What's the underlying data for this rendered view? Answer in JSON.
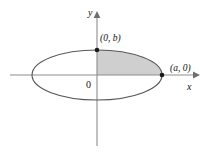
{
  "figure": {
    "background_color": "#ffffff",
    "axes": {
      "x_label": "x",
      "y_label": "y",
      "origin_label": "0",
      "axis_color": "#8d8d8d",
      "x_axis": {
        "start_x": 10,
        "end_x": 196,
        "y": 75,
        "arrow": "right"
      },
      "y_axis": {
        "x": 97,
        "start_y": 145,
        "end_y": 14,
        "arrow": "up"
      }
    },
    "curve": {
      "type": "ellipse",
      "center": {
        "x": 97,
        "y": 75
      },
      "semi_major_a": 65,
      "semi_minor_b": 25,
      "stroke_color": "#575757"
    },
    "shaded_region": {
      "description": "first quadrant of ellipse",
      "fill_color": "#cfcfcf"
    },
    "points": [
      {
        "name": "top-vertex",
        "label": "(0, b)",
        "x": 97,
        "y": 50
      },
      {
        "name": "right-vertex",
        "label": "(a, 0)",
        "x": 162,
        "y": 75
      }
    ]
  }
}
